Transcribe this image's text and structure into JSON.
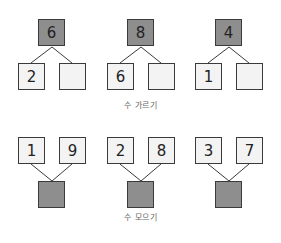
{
  "colors": {
    "dark_box": "#8e8e8e",
    "light_box": "#f3f3f3",
    "border": "#3a3a3a",
    "caption": "#666666"
  },
  "divide": {
    "caption": "수 가르기",
    "groups": [
      {
        "whole": "6",
        "parts": [
          "2",
          ""
        ]
      },
      {
        "whole": "8",
        "parts": [
          "6",
          ""
        ]
      },
      {
        "whole": "4",
        "parts": [
          "1",
          ""
        ]
      }
    ]
  },
  "combine": {
    "caption": "수 모으기",
    "groups": [
      {
        "parts": [
          "1",
          "9"
        ],
        "whole": ""
      },
      {
        "parts": [
          "2",
          "8"
        ],
        "whole": ""
      },
      {
        "parts": [
          "3",
          "7"
        ],
        "whole": ""
      }
    ]
  }
}
